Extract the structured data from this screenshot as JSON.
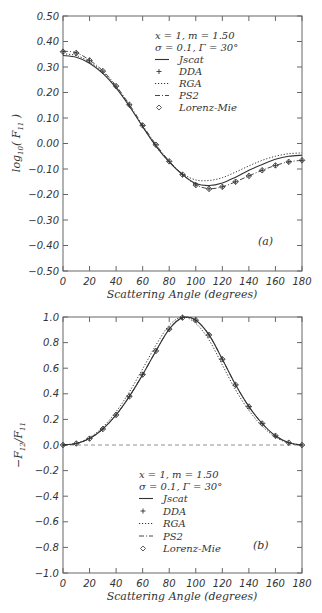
{
  "chart_data": [
    {
      "panel": "(a)",
      "type": "line",
      "title": "",
      "xlabel": "Scattering Angle (degrees)",
      "ylabel": "log10( F11 )",
      "xlim": [
        0,
        180
      ],
      "ylim": [
        -0.5,
        0.5
      ],
      "xticks": [
        "0",
        "20",
        "40",
        "60",
        "80",
        "100",
        "120",
        "140",
        "160",
        "180"
      ],
      "yticks": [
        "0.50",
        "0.40",
        "0.30",
        "0.20",
        "0.10",
        "0.00",
        "-0.10",
        "-0.20",
        "-0.30",
        "-0.40",
        "-0.50"
      ],
      "grid": false,
      "legend_position": "upper right",
      "annotation": [
        "x = 1, m = 1.50",
        "σ = 0.1, Γ = 30°"
      ],
      "x": [
        0,
        10,
        20,
        30,
        40,
        50,
        60,
        70,
        80,
        90,
        100,
        110,
        120,
        130,
        140,
        150,
        160,
        170,
        180
      ],
      "series": [
        {
          "name": "Jscat",
          "style": "solid",
          "values": [
            0.345,
            0.338,
            0.315,
            0.275,
            0.218,
            0.146,
            0.066,
            -0.01,
            -0.072,
            -0.122,
            -0.157,
            -0.165,
            -0.155,
            -0.132,
            -0.105,
            -0.082,
            -0.062,
            -0.05,
            -0.046
          ]
        },
        {
          "name": "DDA",
          "style": "plus-marker",
          "values": [
            0.36,
            0.355,
            0.326,
            0.284,
            0.225,
            0.152,
            0.071,
            -0.005,
            -0.07,
            -0.122,
            -0.163,
            -0.178,
            -0.17,
            -0.15,
            -0.127,
            -0.105,
            -0.086,
            -0.072,
            -0.066
          ]
        },
        {
          "name": "RGA",
          "style": "dotted",
          "values": [
            0.352,
            0.345,
            0.32,
            0.28,
            0.222,
            0.148,
            0.066,
            -0.012,
            -0.072,
            -0.118,
            -0.143,
            -0.145,
            -0.134,
            -0.112,
            -0.088,
            -0.066,
            -0.05,
            -0.04,
            -0.037
          ]
        },
        {
          "name": "PS2",
          "style": "dash-dot",
          "values": [
            0.362,
            0.356,
            0.327,
            0.285,
            0.226,
            0.153,
            0.072,
            -0.004,
            -0.069,
            -0.121,
            -0.162,
            -0.177,
            -0.17,
            -0.15,
            -0.127,
            -0.105,
            -0.086,
            -0.072,
            -0.066
          ]
        },
        {
          "name": "Lorenz-Mie",
          "style": "diamond-marker",
          "values": [
            0.36,
            0.355,
            0.326,
            0.284,
            0.225,
            0.152,
            0.071,
            -0.005,
            -0.07,
            -0.122,
            -0.163,
            -0.178,
            -0.17,
            -0.15,
            -0.127,
            -0.105,
            -0.086,
            -0.072,
            -0.066
          ]
        }
      ]
    },
    {
      "panel": "(b)",
      "type": "line",
      "title": "",
      "xlabel": "Scattering Angle (degrees)",
      "ylabel": "-F12/F11",
      "xlim": [
        0,
        180
      ],
      "ylim": [
        -1.0,
        1.0
      ],
      "xticks": [
        "0",
        "20",
        "40",
        "60",
        "80",
        "100",
        "120",
        "140",
        "160",
        "180"
      ],
      "yticks": [
        "1.0",
        "0.8",
        "0.6",
        "0.4",
        "0.2",
        "0.0",
        "-0.2",
        "-0.4",
        "-0.6",
        "-0.8",
        "-1.0"
      ],
      "grid": false,
      "reference_line": {
        "y": 0.0,
        "style": "dashed"
      },
      "legend_position": "lower center",
      "annotation": [
        "x = 1, m = 1.50",
        "σ = 0.1, Γ = 30°"
      ],
      "x": [
        0,
        10,
        20,
        30,
        40,
        50,
        60,
        70,
        80,
        90,
        100,
        110,
        120,
        130,
        140,
        150,
        160,
        170,
        180
      ],
      "series": [
        {
          "name": "Jscat",
          "style": "solid",
          "values": [
            0.0,
            0.012,
            0.05,
            0.125,
            0.235,
            0.38,
            0.55,
            0.735,
            0.905,
            0.995,
            0.975,
            0.86,
            0.67,
            0.47,
            0.3,
            0.168,
            0.072,
            0.018,
            0.0
          ]
        },
        {
          "name": "DDA",
          "style": "plus-marker",
          "values": [
            0.0,
            0.012,
            0.05,
            0.125,
            0.235,
            0.38,
            0.55,
            0.735,
            0.905,
            0.995,
            0.975,
            0.86,
            0.67,
            0.47,
            0.3,
            0.168,
            0.072,
            0.018,
            0.0
          ]
        },
        {
          "name": "RGA",
          "style": "dotted",
          "values": [
            0.0,
            0.014,
            0.058,
            0.14,
            0.26,
            0.415,
            0.595,
            0.78,
            0.935,
            1.0,
            0.95,
            0.82,
            0.625,
            0.43,
            0.27,
            0.148,
            0.062,
            0.015,
            0.0
          ]
        },
        {
          "name": "PS2",
          "style": "dash-dot",
          "values": [
            0.0,
            0.012,
            0.05,
            0.125,
            0.235,
            0.38,
            0.55,
            0.735,
            0.905,
            0.995,
            0.975,
            0.86,
            0.67,
            0.47,
            0.3,
            0.168,
            0.072,
            0.018,
            0.0
          ]
        },
        {
          "name": "Lorenz-Mie",
          "style": "diamond-marker",
          "values": [
            0.0,
            0.012,
            0.05,
            0.125,
            0.235,
            0.38,
            0.55,
            0.735,
            0.905,
            0.995,
            0.975,
            0.86,
            0.67,
            0.47,
            0.3,
            0.168,
            0.072,
            0.018,
            0.0
          ]
        }
      ]
    }
  ],
  "panels": {
    "a": {
      "ylabel_main": "log",
      "ylabel_sub": "10",
      "ylabel_rest": "( F",
      "ylabel_rest_sub": "11",
      "ylabel_close": " )",
      "xlabel": "Scattering Angle (degrees)",
      "panel_label": "(a)",
      "annotation_line1": "x = 1,  m = 1.50",
      "annotation_line2": "σ = 0.1,  Γ = 30°",
      "legend": [
        "Jscat",
        "DDA",
        "RGA",
        "PS2",
        "Lorenz-Mie"
      ]
    },
    "b": {
      "ylabel_main": "−F",
      "ylabel_sub": "12",
      "ylabel_slash": "/F",
      "ylabel_sub2": "11",
      "xlabel": "Scattering Angle (degrees)",
      "panel_label": "(b)",
      "annotation_line1": "x = 1,  m = 1.50",
      "annotation_line2": "σ = 0.1,  Γ = 30°",
      "legend": [
        "Jscat",
        "DDA",
        "RGA",
        "PS2",
        "Lorenz-Mie"
      ]
    }
  },
  "colors": {
    "line": "#333333",
    "axis": "#555555",
    "background": "#ffffff"
  }
}
